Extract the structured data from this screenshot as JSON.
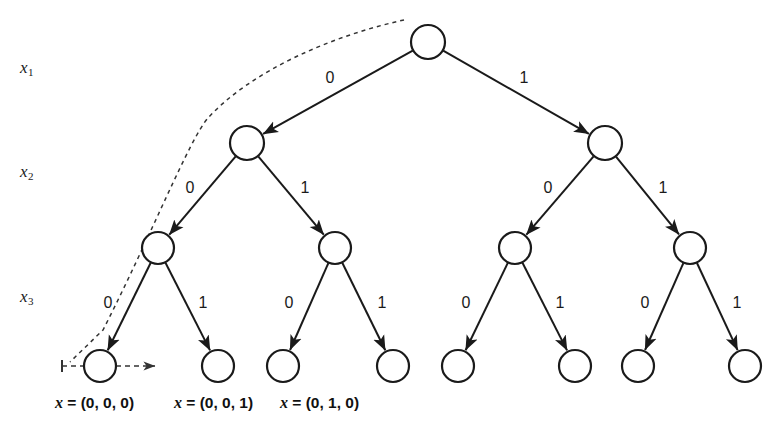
{
  "figure": {
    "background_color": "#ffffff",
    "stroke_color": "#1a1a1a",
    "node_fill": "#ffffff",
    "dashed_color": "#333333",
    "width": 782,
    "height": 441
  },
  "axis_labels": [
    {
      "id": "x1",
      "base": "x",
      "sub": "1",
      "x": 20,
      "y": 58
    },
    {
      "id": "x2",
      "base": "x",
      "sub": "2",
      "x": 20,
      "y": 162
    },
    {
      "id": "x3",
      "base": "x",
      "sub": "3",
      "x": 20,
      "y": 287
    }
  ],
  "nodes": [
    {
      "id": "root",
      "level": 0,
      "cx": 428,
      "cy": 42,
      "r": 17
    },
    {
      "id": "n0",
      "level": 1,
      "cx": 247,
      "cy": 143,
      "r": 17
    },
    {
      "id": "n1",
      "level": 1,
      "cx": 605,
      "cy": 143,
      "r": 17
    },
    {
      "id": "n00",
      "level": 2,
      "cx": 158,
      "cy": 248,
      "r": 16
    },
    {
      "id": "n01",
      "level": 2,
      "cx": 335,
      "cy": 248,
      "r": 16
    },
    {
      "id": "n10",
      "level": 2,
      "cx": 515,
      "cy": 248,
      "r": 16
    },
    {
      "id": "n11",
      "level": 2,
      "cx": 690,
      "cy": 248,
      "r": 16
    },
    {
      "id": "l000",
      "level": 3,
      "cx": 100,
      "cy": 366,
      "r": 16
    },
    {
      "id": "l001",
      "level": 3,
      "cx": 218,
      "cy": 366,
      "r": 16
    },
    {
      "id": "l010",
      "level": 3,
      "cx": 283,
      "cy": 366,
      "r": 16
    },
    {
      "id": "l011",
      "level": 3,
      "cx": 393,
      "cy": 366,
      "r": 16
    },
    {
      "id": "l100",
      "level": 3,
      "cx": 458,
      "cy": 366,
      "r": 16
    },
    {
      "id": "l101",
      "level": 3,
      "cx": 575,
      "cy": 366,
      "r": 16
    },
    {
      "id": "l110",
      "level": 3,
      "cx": 638,
      "cy": 366,
      "r": 16
    },
    {
      "id": "l111",
      "level": 3,
      "cx": 745,
      "cy": 366,
      "r": 16
    }
  ],
  "edges": [
    {
      "id": "e-root-n0",
      "from": "root",
      "to": "n0",
      "label": "0",
      "label_x": 330,
      "label_y": 83
    },
    {
      "id": "e-root-n1",
      "from": "root",
      "to": "n1",
      "label": "1",
      "label_x": 524,
      "label_y": 83
    },
    {
      "id": "e-n0-n00",
      "from": "n0",
      "to": "n00",
      "label": "0",
      "label_x": 190,
      "label_y": 193
    },
    {
      "id": "e-n0-n01",
      "from": "n0",
      "to": "n01",
      "label": "1",
      "label_x": 305,
      "label_y": 193
    },
    {
      "id": "e-n1-n10",
      "from": "n1",
      "to": "n10",
      "label": "0",
      "label_x": 548,
      "label_y": 193
    },
    {
      "id": "e-n1-n11",
      "from": "n1",
      "to": "n11",
      "label": "1",
      "label_x": 663,
      "label_y": 193
    },
    {
      "id": "e-n00-l000",
      "from": "n00",
      "to": "l000",
      "label": "0",
      "label_x": 108,
      "label_y": 308
    },
    {
      "id": "e-n00-l001",
      "from": "n00",
      "to": "l001",
      "label": "1",
      "label_x": 203,
      "label_y": 308
    },
    {
      "id": "e-n01-l010",
      "from": "n01",
      "to": "l010",
      "label": "0",
      "label_x": 289,
      "label_y": 308
    },
    {
      "id": "e-n01-l011",
      "from": "n01",
      "to": "l011",
      "label": "1",
      "label_x": 382,
      "label_y": 308
    },
    {
      "id": "e-n10-l100",
      "from": "n10",
      "to": "l100",
      "label": "0",
      "label_x": 466,
      "label_y": 308
    },
    {
      "id": "e-n10-l101",
      "from": "n10",
      "to": "l101",
      "label": "1",
      "label_x": 560,
      "label_y": 308
    },
    {
      "id": "e-n11-l110",
      "from": "n11",
      "to": "l110",
      "label": "0",
      "label_x": 645,
      "label_y": 308
    },
    {
      "id": "e-n11-l111",
      "from": "n11",
      "to": "l111",
      "label": "1",
      "label_x": 737,
      "label_y": 308
    }
  ],
  "traversal_path": {
    "id": "dashed-traversal-path",
    "style": "dashed",
    "curve_d": "M 404 20 C 330 36, 250 72, 208 118 C 190 138, 150 238, 103 330 L 70 362",
    "line_d": "M 62 366 L 155 366",
    "tick_d": "M 62 360 L 62 372",
    "arrow_at": {
      "x": 155,
      "y": 366
    }
  },
  "leaf_captions": [
    {
      "id": "caption-000",
      "prefix": "x",
      "eq": " = (0, 0, 0)",
      "x": 55
    },
    {
      "id": "caption-001",
      "prefix": "x",
      "eq": " = (0, 0, 1)",
      "x": 174
    },
    {
      "id": "caption-010",
      "prefix": "x",
      "eq": " = (0, 1, 0)",
      "x": 280
    }
  ]
}
